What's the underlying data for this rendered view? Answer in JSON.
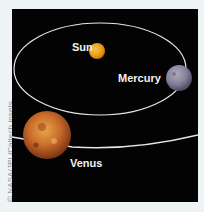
{
  "credit": "© NASA/JPL/Caltech insets",
  "bodies": {
    "sun": {
      "label": "Sun",
      "color": "#e8a21c"
    },
    "mercury": {
      "label": "Mercury",
      "color": "#8a8398"
    },
    "venus": {
      "label": "Venus",
      "color": "#c0612a"
    }
  },
  "colors": {
    "background": "#eef3f6",
    "panel": "#030303",
    "orbit": "#e6e6e6",
    "label": "#f2f2f2"
  }
}
